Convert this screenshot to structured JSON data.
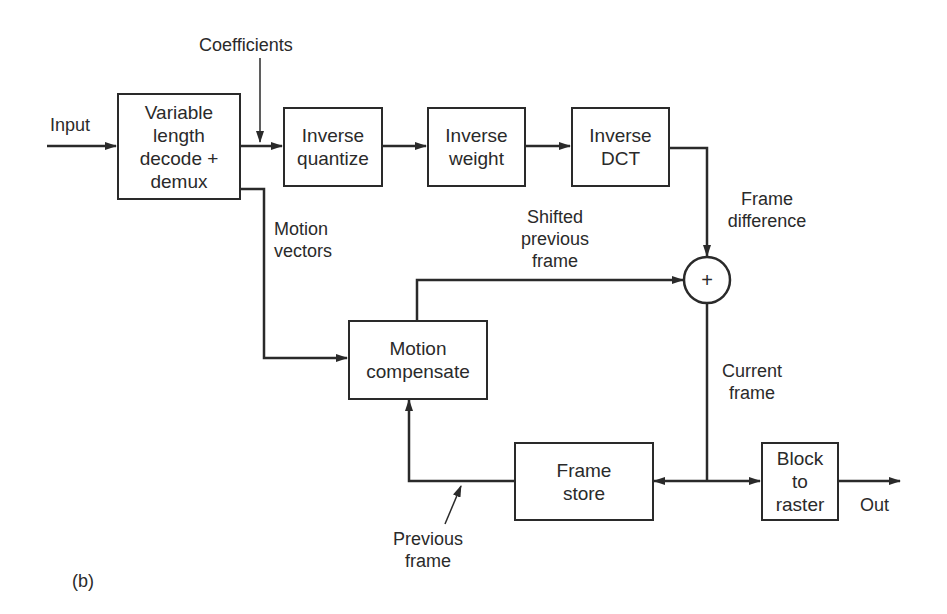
{
  "figure_label": "(b)",
  "blocks": {
    "vld": "Variable\nlength\ndecode +\ndemux",
    "inverse_quantize": "Inverse\nquantize",
    "inverse_weight": "Inverse\nweight",
    "inverse_dct": "Inverse\nDCT",
    "motion_compensate": "Motion\ncompensate",
    "frame_store": "Frame\nstore",
    "block_to_raster": "Block\nto\nraster"
  },
  "summer": {
    "symbol": "+"
  },
  "labels": {
    "input": "Input",
    "coefficients": "Coefficients",
    "motion_vectors": "Motion\nvectors",
    "shifted_previous_frame": "Shifted\nprevious\nframe",
    "frame_difference": "Frame\ndifference",
    "current_frame": "Current\nframe",
    "previous_frame": "Previous\nframe",
    "out": "Out"
  },
  "colors": {
    "ink": "#2a2a2a",
    "background": "#ffffff"
  }
}
